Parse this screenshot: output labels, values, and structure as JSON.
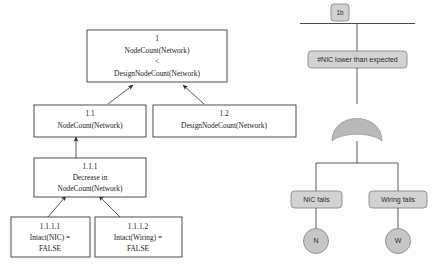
{
  "goal_structuring_diagram": {
    "name": "goal-decomposition-tree",
    "nodes": {
      "top": {
        "id": "1",
        "line1": "NodeCount(Network)",
        "line2": "<",
        "line3": "DesignNodeCount(Network)"
      },
      "left_mid": {
        "id": "1.1",
        "line1": "NodeCount(Network)"
      },
      "right_mid": {
        "id": "1.2",
        "line1": "DesignNodeCount(Network)"
      },
      "decrease": {
        "id": "1.1.1",
        "line1": "Decrease in",
        "line2": "NodeCount(Network)"
      },
      "leaf_nic": {
        "id": "1.1.1.1",
        "line1": "Intact(NIC) =",
        "line2": "FALSE"
      },
      "leaf_wiring": {
        "id": "1.1.1.2",
        "line1": "Intact(Wiring) =",
        "line2": "FALSE"
      }
    }
  },
  "fault_tree": {
    "name": "fault-tree",
    "transfer_label": "1b",
    "top_event": "#NIC lower than expected",
    "gate_type": "or-gate",
    "events": [
      {
        "label": "NIC fails",
        "basic_event": "N"
      },
      {
        "label": "Wiring fails",
        "basic_event": "W"
      }
    ]
  },
  "colors": {
    "box_stroke": "#3a3a3a",
    "box_fill": "#ffffff",
    "shaded_fill": "#d2d2d2",
    "shaded_stroke": "#8a8a8a",
    "line": "#4a4a4a",
    "text": "#1b1b1b"
  }
}
